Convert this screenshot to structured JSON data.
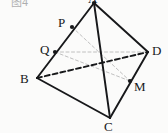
{
  "figure": {
    "caption": "图4",
    "caption_pos": {
      "x": 11,
      "y": -3
    },
    "type": "solid-geometry-diagram",
    "shape": "tetrahedron",
    "width": 168,
    "height": 133,
    "background_color": "#fbfbfa",
    "stroke_color": "#17181a",
    "auxiliary_color": "#b9b9b9"
  },
  "points": {
    "A": {
      "label": "A",
      "x": 94,
      "y": 3,
      "dot": true,
      "label_x": 88,
      "label_y": -8
    },
    "B": {
      "label": "B",
      "x": 37,
      "y": 78,
      "dot": false,
      "label_x": 20,
      "label_y": 72
    },
    "C": {
      "label": "C",
      "x": 110,
      "y": 118,
      "dot": false,
      "label_x": 104,
      "label_y": 120
    },
    "D": {
      "label": "D",
      "x": 148,
      "y": 52,
      "dot": false,
      "label_x": 152,
      "label_y": 44
    },
    "P": {
      "label": "P",
      "x": 72,
      "y": 27,
      "dot": true,
      "label_x": 58,
      "label_y": 16
    },
    "Q": {
      "label": "Q",
      "x": 55,
      "y": 52,
      "dot": true,
      "label_x": 40,
      "label_y": 43
    },
    "M": {
      "label": "M",
      "x": 130,
      "y": 81,
      "dot": true,
      "label_x": 134,
      "label_y": 80
    }
  },
  "edges": [
    {
      "name": "edge-AB",
      "from": "A",
      "to": "B",
      "style": "solid",
      "width": 1.9,
      "color": "#17181a"
    },
    {
      "name": "edge-AC",
      "from": "A",
      "to": "C",
      "style": "solid",
      "width": 1.9,
      "color": "#17181a"
    },
    {
      "name": "edge-AD",
      "from": "A",
      "to": "D",
      "style": "solid",
      "width": 1.9,
      "color": "#17181a"
    },
    {
      "name": "edge-BC",
      "from": "B",
      "to": "C",
      "style": "solid",
      "width": 1.9,
      "color": "#17181a"
    },
    {
      "name": "edge-CD",
      "from": "C",
      "to": "D",
      "style": "solid",
      "width": 1.9,
      "color": "#17181a"
    },
    {
      "name": "edge-BD",
      "from": "B",
      "to": "D",
      "style": "dashed",
      "width": 1.9,
      "color": "#17181a",
      "dasharray": "5 3"
    }
  ],
  "auxiliary_lines": [
    {
      "name": "aux-PM",
      "from": "P",
      "to": "M",
      "style": "dashed",
      "width": 0.9,
      "color": "#b9b9b9",
      "dasharray": "3 2.5"
    },
    {
      "name": "aux-QM",
      "from": "Q",
      "to": "M",
      "style": "dashed",
      "width": 0.9,
      "color": "#b9b9b9",
      "dasharray": "3 2.5"
    },
    {
      "name": "aux-QD",
      "from": "Q",
      "to": "D",
      "style": "dashed",
      "width": 0.9,
      "color": "#b9b9b9",
      "dasharray": "3 2.5"
    }
  ]
}
